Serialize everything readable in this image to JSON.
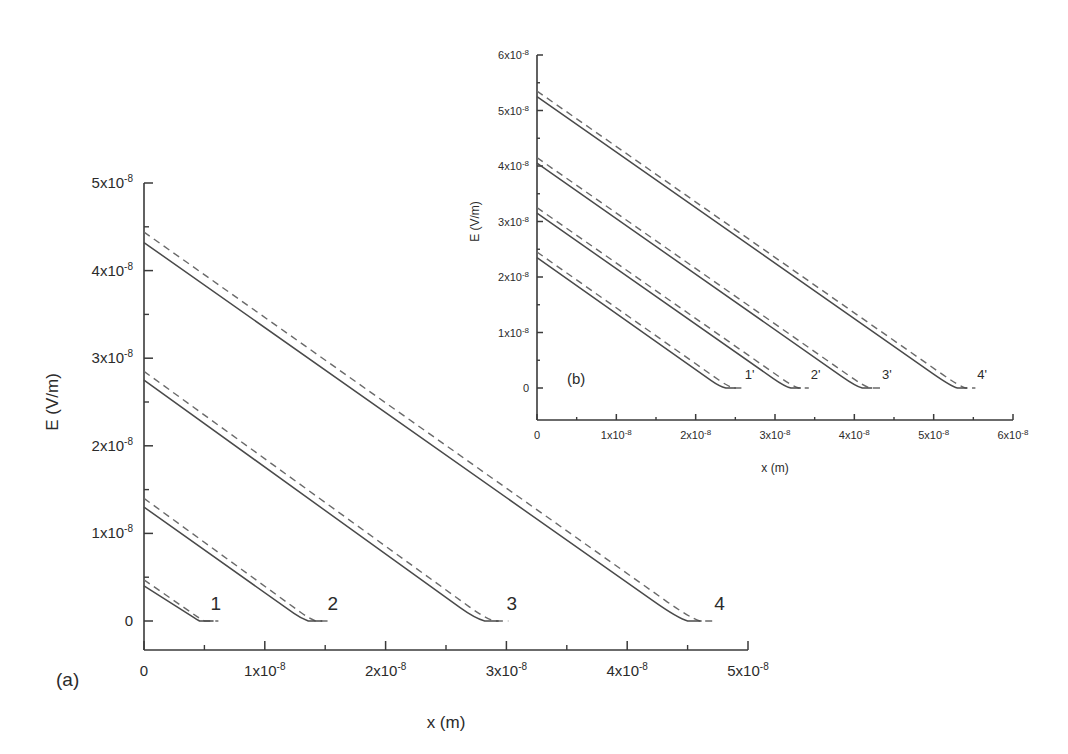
{
  "figure": {
    "background": "#ffffff",
    "line_color": "#4a4a4a",
    "dash_color": "#6a6a6a",
    "axis_color": "#3a3a3a"
  },
  "chart_data": [
    {
      "id": "panel-a",
      "type": "line",
      "panel_label": "(a)",
      "title": "",
      "xlabel": "x (m)",
      "ylabel": "E (V/m)",
      "xlim": [
        0,
        5e-08
      ],
      "ylim": [
        0,
        5e-08
      ],
      "grid": false,
      "legend": "none",
      "xticks": [
        0,
        1e-08,
        2e-08,
        3e-08,
        4e-08,
        5e-08
      ],
      "xticklabels": [
        "0",
        "1x10",
        "2x10",
        "3x10",
        "4x10",
        "5x10"
      ],
      "xtick_exponents": [
        "",
        "-8",
        "-8",
        "-8",
        "-8",
        "-8"
      ],
      "yticks": [
        0,
        1e-08,
        2e-08,
        3e-08,
        4e-08,
        5e-08
      ],
      "yticklabels": [
        "0",
        "1x10",
        "2x10",
        "3x10",
        "4x10",
        "5x10"
      ],
      "ytick_exponents": [
        "",
        "-8",
        "-8",
        "-8",
        "-8",
        "-8"
      ],
      "minor_ticks": true,
      "series": [
        {
          "name": "1",
          "label": "1",
          "label_x": 5.5e-09,
          "label_y": 1.3e-09,
          "solid": {
            "x": [
              0,
              4.3e-09,
              4.6e-09
            ],
            "y": [
              4e-09,
              2.5e-10,
              0
            ]
          },
          "dashed": {
            "x": [
              0,
              4.6e-09,
              5e-09
            ],
            "y": [
              4.7e-09,
              3e-10,
              0
            ]
          }
        },
        {
          "name": "2",
          "label": "2",
          "label_x": 1.52e-08,
          "label_y": 1.3e-09,
          "solid": {
            "x": [
              0,
              1.3e-08,
              1.36e-08
            ],
            "y": [
              1.3e-08,
              3e-10,
              0
            ]
          },
          "dashed": {
            "x": [
              0,
              1.36e-08,
              1.42e-08
            ],
            "y": [
              1.4e-08,
              3.5e-10,
              0
            ]
          }
        },
        {
          "name": "3",
          "label": "3",
          "label_x": 3e-08,
          "label_y": 1.3e-09,
          "solid": {
            "x": [
              0,
              2.74e-08,
              2.82e-08
            ],
            "y": [
              2.75e-08,
              3e-10,
              0
            ]
          },
          "dashed": {
            "x": [
              0,
              2.82e-08,
              2.9e-08
            ],
            "y": [
              2.85e-08,
              3.5e-10,
              0
            ]
          }
        },
        {
          "name": "4",
          "label": "4",
          "label_x": 4.72e-08,
          "label_y": 1.3e-09,
          "solid": {
            "x": [
              0,
              4.42e-08,
              4.5e-08
            ],
            "y": [
              4.32e-08,
              3e-10,
              0
            ]
          },
          "dashed": {
            "x": [
              0,
              4.52e-08,
              4.6e-08
            ],
            "y": [
              4.44e-08,
              3.5e-10,
              0
            ]
          }
        }
      ]
    },
    {
      "id": "panel-b",
      "type": "line",
      "panel_label": "(b)",
      "title": "",
      "xlabel": "x (m)",
      "ylabel": "E (V/m)",
      "xlim": [
        0,
        6e-08
      ],
      "ylim": [
        0,
        6e-08
      ],
      "grid": false,
      "legend": "none",
      "xticks": [
        0,
        1e-08,
        2e-08,
        3e-08,
        4e-08,
        5e-08,
        6e-08
      ],
      "xticklabels": [
        "0",
        "1x10",
        "2x10",
        "3x10",
        "4x10",
        "5x10",
        "6x10"
      ],
      "xtick_exponents": [
        "",
        "-8",
        "-8",
        "-8",
        "-8",
        "-8",
        "-8"
      ],
      "yticks": [
        0,
        1e-08,
        2e-08,
        3e-08,
        4e-08,
        5e-08,
        6e-08
      ],
      "yticklabels": [
        "0",
        "1x10",
        "2x10",
        "3x10",
        "4x10",
        "5x10",
        "6x10"
      ],
      "ytick_exponents": [
        "",
        "-8",
        "-8",
        "-8",
        "-8",
        "-8",
        "-8"
      ],
      "minor_ticks": true,
      "series": [
        {
          "name": "1'",
          "label": "1'",
          "label_x": 2.62e-08,
          "label_y": 1.6e-09,
          "solid": {
            "x": [
              0,
              2.3e-08,
              2.38e-08
            ],
            "y": [
              2.35e-08,
              3e-10,
              0
            ]
          },
          "dashed": {
            "x": [
              0,
              2.4e-08,
              2.48e-08
            ],
            "y": [
              2.45e-08,
              3.5e-10,
              0
            ]
          }
        },
        {
          "name": "2'",
          "label": "2'",
          "label_x": 3.45e-08,
          "label_y": 1.6e-09,
          "solid": {
            "x": [
              0,
              3.12e-08,
              3.2e-08
            ],
            "y": [
              3.15e-08,
              3e-10,
              0
            ]
          },
          "dashed": {
            "x": [
              0,
              3.22e-08,
              3.3e-08
            ],
            "y": [
              3.25e-08,
              3.5e-10,
              0
            ]
          }
        },
        {
          "name": "3'",
          "label": "3'",
          "label_x": 4.35e-08,
          "label_y": 1.6e-09,
          "solid": {
            "x": [
              0,
              4.02e-08,
              4.1e-08
            ],
            "y": [
              4.05e-08,
              3e-10,
              0
            ]
          },
          "dashed": {
            "x": [
              0,
              4.12e-08,
              4.2e-08
            ],
            "y": [
              4.15e-08,
              3.5e-10,
              0
            ]
          }
        },
        {
          "name": "4'",
          "label": "4'",
          "label_x": 5.55e-08,
          "label_y": 1.6e-09,
          "solid": {
            "x": [
              0,
              5.22e-08,
              5.3e-08
            ],
            "y": [
              5.25e-08,
              3e-10,
              0
            ]
          },
          "dashed": {
            "x": [
              0,
              5.32e-08,
              5.4e-08
            ],
            "y": [
              5.35e-08,
              3.5e-10,
              0
            ]
          }
        }
      ]
    }
  ],
  "panel_a_geometry": {
    "x0": 144,
    "x1": 748,
    "ybase": 650,
    "yzero": 621,
    "ytop": 183,
    "major_tick": 9,
    "minor_tick": 5
  },
  "panel_b_geometry": {
    "x0": 537,
    "x1": 1013,
    "ybase": 420,
    "yzero": 388,
    "ytop": 55,
    "major_tick": 6,
    "minor_tick": 3
  }
}
